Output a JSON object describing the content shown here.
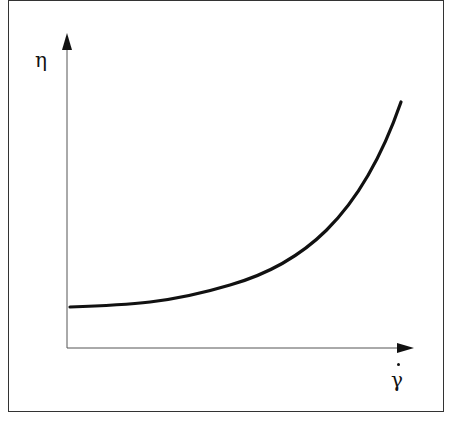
{
  "diagram": {
    "y_axis_label": "η",
    "x_axis_label": "γ",
    "x_axis_label_has_dot": true,
    "curve_description": "shear-thickening viscosity curve: flat at low shear rate, rising steeply at high shear rate",
    "colors": {
      "line": "#111111",
      "frame": "#333333",
      "background": "#ffffff"
    }
  }
}
